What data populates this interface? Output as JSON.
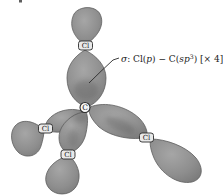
{
  "annotation": {
    "sigma": "σ",
    "prefix": ": Cl(",
    "p": "p",
    "mid": ") − C(",
    "sp": "sp",
    "sup": "3",
    "suffix": ") [× 4]"
  },
  "atoms": {
    "carbon": "C",
    "chlorine": "Cl"
  },
  "colors": {
    "background": "#ffffff",
    "lobe-light": "#a6a6a6",
    "lobe-mid": "#8e8e8e",
    "lobe-dark": "#787878",
    "lobe-edge": "#5e5e5e",
    "shade": "#1a1a1a",
    "label-bg": "#e9e9e9",
    "label-border": "#2b2b2b",
    "label-text": "#141414",
    "atom-circle-bg": "#f7f7f7",
    "annotation-text": "#1a1a1a",
    "leader-line": "#2a2a2a"
  }
}
